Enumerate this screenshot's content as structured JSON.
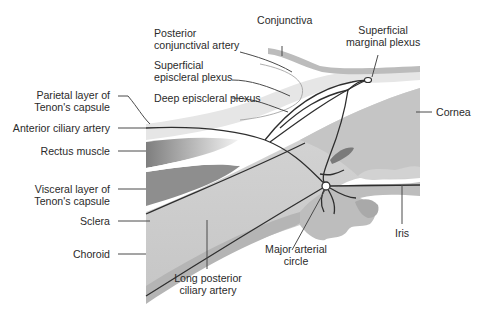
{
  "diagram": {
    "colors": {
      "background": "#ffffff",
      "sclera": "#cfcfcf",
      "cornea": "#c9c9c9",
      "choroid": "#b7b7b7",
      "conjunctiva": "#bdbdbd",
      "tenon_parietal": "#e4e4e4",
      "muscle_dark": "#8a8a8a",
      "muscle_light": "#ececec",
      "vessel": "#2e2e2e",
      "leader_line": "#4a4a4a",
      "label_text": "#2b2b2b"
    }
  },
  "labels": {
    "posterior_conjunctival_artery": [
      "Posterior",
      "conjunctival artery"
    ],
    "conjunctiva": [
      "Conjunctiva"
    ],
    "superficial_marginal_plexus": [
      "Superficial",
      "marginal plexus"
    ],
    "superficial_episcleral_plexus": [
      "Superficial",
      "episcleral plexus"
    ],
    "deep_episcleral_plexus": [
      "Deep episcleral plexus"
    ],
    "parietal_tenon": [
      "Parietal layer of",
      "Tenon's capsule"
    ],
    "cornea": [
      "Cornea"
    ],
    "anterior_ciliary_artery": [
      "Anterior ciliary artery"
    ],
    "rectus_muscle": [
      "Rectus muscle"
    ],
    "visceral_tenon": [
      "Visceral layer of",
      "Tenon's capsule"
    ],
    "sclera": [
      "Sclera"
    ],
    "iris": [
      "Iris"
    ],
    "choroid": [
      "Choroid"
    ],
    "major_arterial_circle": [
      "Major arterial",
      "circle"
    ],
    "long_posterior_ciliary_artery": [
      "Long posterior",
      "ciliary artery"
    ]
  }
}
